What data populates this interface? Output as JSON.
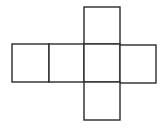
{
  "diagram": {
    "title": "",
    "type": "cube-net",
    "stroke_color": "#2a2a2a",
    "background": "#ffffff",
    "faces": [
      {
        "id": "top",
        "x": 84,
        "y": 7,
        "w": 36,
        "h": 37
      },
      {
        "id": "left-1",
        "x": 12,
        "y": 44,
        "w": 37,
        "h": 38
      },
      {
        "id": "left-2",
        "x": 49,
        "y": 44,
        "w": 35,
        "h": 38
      },
      {
        "id": "center",
        "x": 84,
        "y": 44,
        "w": 36,
        "h": 38
      },
      {
        "id": "right",
        "x": 120,
        "y": 45,
        "w": 36,
        "h": 38
      },
      {
        "id": "bottom",
        "x": 84,
        "y": 82,
        "w": 36,
        "h": 38
      }
    ]
  }
}
